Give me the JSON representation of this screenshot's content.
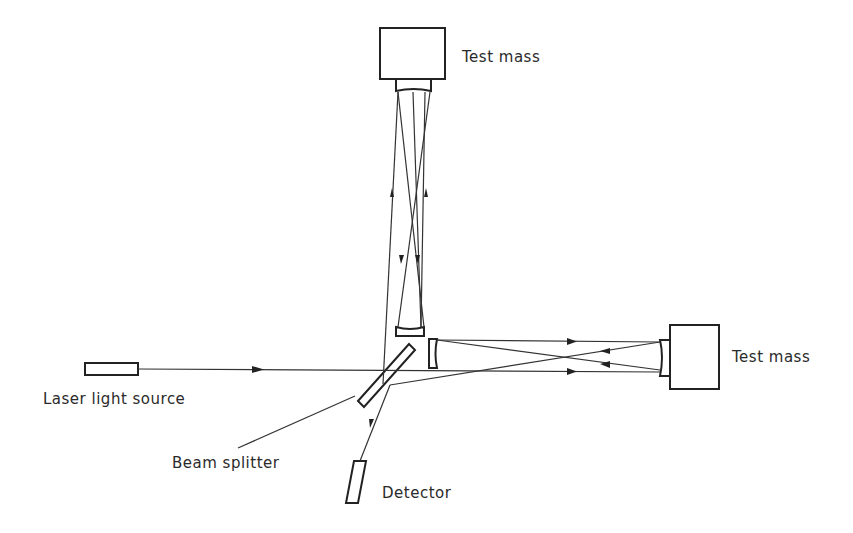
{
  "diagram": {
    "labels": {
      "test_mass_top": "Test mass",
      "test_mass_right": "Test mass",
      "laser": "Laser light source",
      "beam_splitter": "Beam splitter",
      "detector": "Detector"
    },
    "components": [
      {
        "id": "laser",
        "label": "Laser light source"
      },
      {
        "id": "beam-splitter",
        "label": "Beam splitter"
      },
      {
        "id": "detector",
        "label": "Detector"
      },
      {
        "id": "test-mass-top",
        "label": "Test mass"
      },
      {
        "id": "test-mass-right",
        "label": "Test mass"
      },
      {
        "id": "input-mirror-vertical",
        "label": ""
      },
      {
        "id": "input-mirror-horizontal",
        "label": ""
      }
    ],
    "colors": {
      "line": "#222222",
      "background": "#ffffff"
    }
  }
}
